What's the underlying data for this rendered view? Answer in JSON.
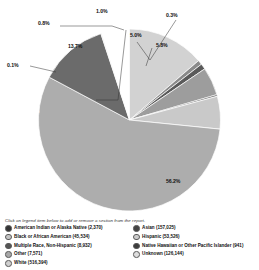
{
  "legend_hint": "Click on legend item below to add or remove a section from the report.",
  "chart_data": {
    "type": "pie",
    "title": "",
    "start_angle_deg": 0,
    "direction": "clockwise",
    "legend_position": "bottom",
    "grid": false,
    "total": 877074,
    "categories": [
      "American Indian or Alaska Native",
      "Asian",
      "Black or African American",
      "Hispanic",
      "Multiple Race, Non-Hispanic",
      "Native Hawaiian or Other Pacific Islander",
      "Other",
      "Unknown",
      "White"
    ],
    "slices": [
      {
        "label": "Unknown",
        "count": "126,144",
        "percent": 13.7,
        "percent_label": "13.7%",
        "color": "#d2d2d2",
        "label_style": "inside"
      },
      {
        "label": "Other",
        "count": "7,571",
        "percent": 0.8,
        "percent_label": "0.8%",
        "color": "#8a8a8a",
        "label_style": "leader"
      },
      {
        "label": "Multiple Race, Non-Hispanic",
        "count": "8,932",
        "percent": 1.0,
        "percent_label": "1.0%",
        "color": "#5a5a5a",
        "label_style": "leader"
      },
      {
        "label": "Hispanic",
        "count": "53,526",
        "percent": 5.0,
        "percent_label": "5.0%",
        "color": "#9d9d9d",
        "label_style": "inside"
      },
      {
        "label": "Native Hawaiian or Other Pacific Islander",
        "count": "941",
        "percent": 0.3,
        "percent_label": "0.3%",
        "color": "#6f6f6f",
        "label_style": "leader"
      },
      {
        "label": "Asian",
        "count": "157,025",
        "percent": 5.8,
        "percent_label": "5.8%",
        "color": "#c9c9c9",
        "label_style": "inside"
      },
      {
        "label": "White",
        "count": "516,394",
        "percent": 56.2,
        "percent_label": "56.2%",
        "color": "#adadad",
        "label_style": "inside"
      },
      {
        "label": "Black or African American",
        "count": "45,534",
        "percent": 12.1,
        "percent_label": "12.1%",
        "color": "#6b6b6b",
        "label_style": "inside-dark"
      },
      {
        "label": "American Indian or Alaska Native",
        "count": "2,370",
        "percent": 0.1,
        "percent_label": "0.1%",
        "color": "#bdbdbd",
        "label_style": "leader"
      }
    ]
  },
  "callouts": [
    {
      "text": "0.8%",
      "x": 38,
      "y": 20
    },
    {
      "text": "1.0%",
      "x": 96,
      "y": 8
    },
    {
      "text": "0.3%",
      "x": 166,
      "y": 12
    },
    {
      "text": "5.0%",
      "x": 130,
      "y": 32
    },
    {
      "text": "5.8%",
      "x": 156,
      "y": 42
    },
    {
      "text": "13.7%",
      "x": 68,
      "y": 43
    },
    {
      "text": "0.1%",
      "x": 7,
      "y": 62
    },
    {
      "text": "12.1%",
      "x": 25,
      "y": 108
    },
    {
      "text": "56.2%",
      "x": 166,
      "y": 178
    }
  ],
  "legend": {
    "left_column": [
      {
        "label": "American Indian or Alaska Native (2,370)",
        "color": "#333333"
      },
      {
        "label": "Black or African American (45,534)",
        "color": "#c4c4c4"
      },
      {
        "label": "Multiple Race, Non-Hispanic (8,932)",
        "color": "#555555"
      },
      {
        "label": "Other (7,571)",
        "color": "#a8a8a8"
      },
      {
        "label": "White (516,394)",
        "color": "#cfcfcf"
      }
    ],
    "right_column": [
      {
        "label": "Asian (157,025)",
        "color": "#444444"
      },
      {
        "label": "Hispanic (53,526)",
        "color": "#cccccc"
      },
      {
        "label": "Native Hawaiian or Other Pacific Islander (941)",
        "color": "#3d3d3d"
      },
      {
        "label": "Unknown (126,144)",
        "color": "#dedede"
      }
    ]
  }
}
